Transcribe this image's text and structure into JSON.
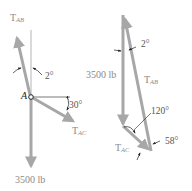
{
  "colors": {
    "vector": "#a7a7a7",
    "line": "#b5b5b5",
    "text": "#8a8a8a",
    "dark": "#222222"
  },
  "left_figure": {
    "point_label": "A",
    "tab": {
      "main": "T",
      "sub": "AB"
    },
    "tac": {
      "main": "T",
      "sub": "AC"
    },
    "angle_top": "2°",
    "angle_right": "30°",
    "load": "3500 lb"
  },
  "right_figure": {
    "load": "3500 lb",
    "tab": {
      "main": "T",
      "sub": "AB"
    },
    "tac": {
      "main": "T",
      "sub": "AC"
    },
    "angle_top": "2°",
    "angle_mid": "120°",
    "angle_bottom": "58°"
  }
}
